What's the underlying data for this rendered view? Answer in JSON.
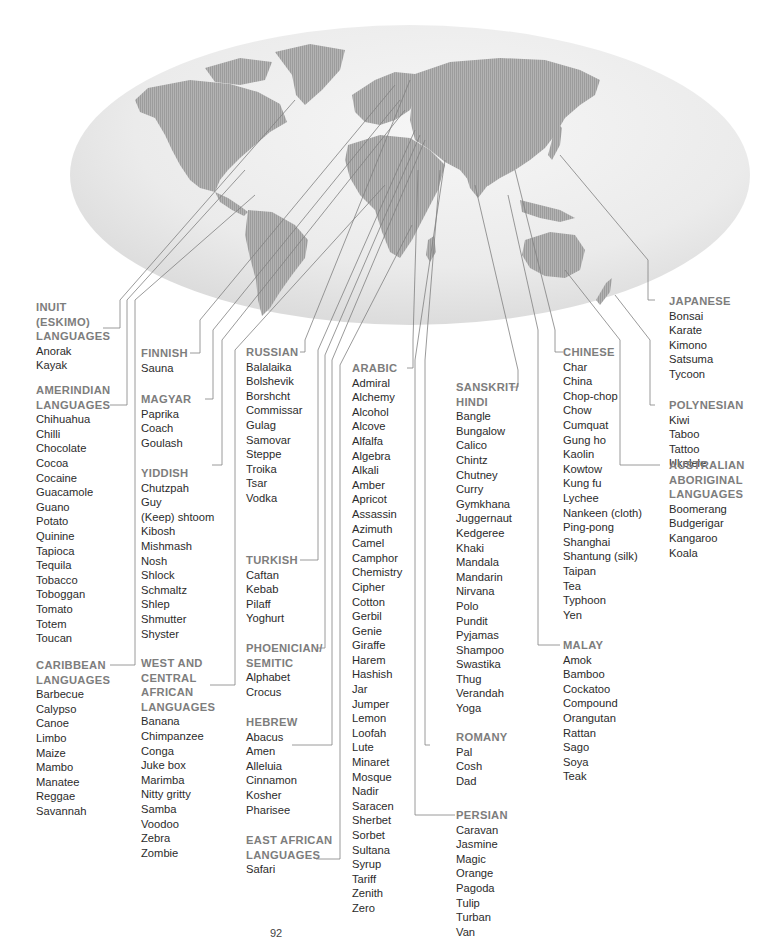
{
  "page": {
    "page_number": "92",
    "top_text_cutoff": "(cut-off line of text above map)"
  },
  "map": {
    "description": "World map on pale gray ellipse with leader lines from language regions to word lists",
    "colors": {
      "globe": "#ececec",
      "land": "#a9a9a9",
      "lines": "#777777",
      "heading": "#7d7d7d",
      "text": "#2b2b2b"
    }
  },
  "groups": [
    {
      "id": "inuit",
      "heading": [
        "INUIT",
        "(ESKIMO)",
        "LANGUAGES"
      ],
      "words": [
        "Anorak",
        "Kayak"
      ]
    },
    {
      "id": "amerindian",
      "heading": [
        "AMERINDIAN",
        "LANGUAGES"
      ],
      "words": [
        "Chihuahua",
        "Chilli",
        "Chocolate",
        "Cocoa",
        "Cocaine",
        "Guacamole",
        "Guano",
        "Potato",
        "Quinine",
        "Tapioca",
        "Tequila",
        "Tobacco",
        "Toboggan",
        "Tomato",
        "Totem",
        "Toucan"
      ]
    },
    {
      "id": "caribbean",
      "heading": [
        "CARIBBEAN",
        "LANGUAGES"
      ],
      "words": [
        "Barbecue",
        "Calypso",
        "Canoe",
        "Limbo",
        "Maize",
        "Mambo",
        "Manatee",
        "Reggae",
        "Savannah"
      ]
    },
    {
      "id": "finnish",
      "heading": [
        "FINNISH"
      ],
      "words": [
        "Sauna"
      ]
    },
    {
      "id": "magyar",
      "heading": [
        "MAGYAR"
      ],
      "words": [
        "Paprika",
        "Coach",
        "Goulash"
      ]
    },
    {
      "id": "yiddish",
      "heading": [
        "YIDDISH"
      ],
      "words": [
        "Chutzpah",
        "Guy",
        "(Keep) shtoom",
        "Kibosh",
        "Mishmash",
        "Nosh",
        "Shlock",
        "Schmaltz",
        "Shlep",
        "Shmutter",
        "Shyster"
      ]
    },
    {
      "id": "west-central-african",
      "heading": [
        "WEST AND",
        "CENTRAL",
        "AFRICAN",
        "LANGUAGES"
      ],
      "words": [
        "Banana",
        "Chimpanzee",
        "Conga",
        "Juke box",
        "Marimba",
        "Nitty gritty",
        "Samba",
        "Voodoo",
        "Zebra",
        "Zombie"
      ]
    },
    {
      "id": "russian",
      "heading": [
        "RUSSIAN"
      ],
      "words": [
        "Balalaika",
        "Bolshevik",
        "Borshcht",
        "Commissar",
        "Gulag",
        "Samovar",
        "Steppe",
        "Troika",
        "Tsar",
        "Vodka"
      ]
    },
    {
      "id": "turkish",
      "heading": [
        "TURKISH"
      ],
      "words": [
        "Caftan",
        "Kebab",
        "Pilaff",
        "Yoghurt"
      ]
    },
    {
      "id": "phoenician-semitic",
      "heading": [
        "PHOENICIAN/",
        "SEMITIC"
      ],
      "words": [
        "Alphabet",
        "Crocus"
      ]
    },
    {
      "id": "hebrew",
      "heading": [
        "HEBREW"
      ],
      "words": [
        "Abacus",
        "Amen",
        "Alleluia",
        "Cinnamon",
        "Kosher",
        "Pharisee"
      ]
    },
    {
      "id": "east-african",
      "heading": [
        "EAST AFRICAN",
        "LANGUAGES"
      ],
      "words": [
        "Safari"
      ]
    },
    {
      "id": "arabic",
      "heading": [
        "ARABIC"
      ],
      "words": [
        "Admiral",
        "Alchemy",
        "Alcohol",
        "Alcove",
        "Alfalfa",
        "Algebra",
        "Alkali",
        "Amber",
        "Apricot",
        "Assassin",
        "Azimuth",
        "Camel",
        "Camphor",
        "Chemistry",
        "Cipher",
        "Cotton",
        "Gerbil",
        "Genie",
        "Giraffe",
        "Harem",
        "Hashish",
        "Jar",
        "Jumper",
        "Lemon",
        "Loofah",
        "Lute",
        "Minaret",
        "Mosque",
        "Nadir",
        "Saracen",
        "Sherbet",
        "Sorbet",
        "Sultana",
        "Syrup",
        "Tariff",
        "Zenith",
        "Zero"
      ]
    },
    {
      "id": "sanskrit-hindi",
      "heading": [
        "SANSKRIT/",
        "HINDI"
      ],
      "words": [
        "Bangle",
        "Bungalow",
        "Calico",
        "Chintz",
        "Chutney",
        "Curry",
        "Gymkhana",
        "Juggernaut",
        "Kedgeree",
        "Khaki",
        "Mandala",
        "Mandarin",
        "Nirvana",
        "Polo",
        "Pundit",
        "Pyjamas",
        "Shampoo",
        "Swastika",
        "Thug",
        "Verandah",
        "Yoga"
      ]
    },
    {
      "id": "romany",
      "heading": [
        "ROMANY"
      ],
      "words": [
        "Pal",
        "Cosh",
        "Dad"
      ]
    },
    {
      "id": "persian",
      "heading": [
        "PERSIAN"
      ],
      "words": [
        "Caravan",
        "Jasmine",
        "Magic",
        "Orange",
        "Pagoda",
        "Tulip",
        "Turban",
        "Van"
      ]
    },
    {
      "id": "chinese",
      "heading": [
        "CHINESE"
      ],
      "words": [
        "Char",
        "China",
        "Chop-chop",
        "Chow",
        "Cumquat",
        "Gung ho",
        "Kaolin",
        "Kowtow",
        "Kung fu",
        "Lychee",
        "Nankeen (cloth)",
        "Ping-pong",
        "Shanghai",
        "Shantung (silk)",
        "Taipan",
        "Tea",
        "Typhoon",
        "Yen"
      ]
    },
    {
      "id": "malay",
      "heading": [
        "MALAY"
      ],
      "words": [
        "Amok",
        "Bamboo",
        "Cockatoo",
        "Compound",
        "Orangutan",
        "Rattan",
        "Sago",
        "Soya",
        "Teak"
      ]
    },
    {
      "id": "japanese",
      "heading": [
        "JAPANESE"
      ],
      "words": [
        "Bonsai",
        "Karate",
        "Kimono",
        "Satsuma",
        "Tycoon"
      ]
    },
    {
      "id": "polynesian",
      "heading": [
        "POLYNESIAN"
      ],
      "words": [
        "Kiwi",
        "Taboo",
        "Tattoo",
        "Ukelele"
      ]
    },
    {
      "id": "australian-aboriginal",
      "heading": [
        "AUSTRALIAN",
        "ABORIGINAL",
        "LANGUAGES"
      ],
      "words": [
        "Boomerang",
        "Budgerigar",
        "Kangaroo",
        "Koala"
      ]
    }
  ]
}
